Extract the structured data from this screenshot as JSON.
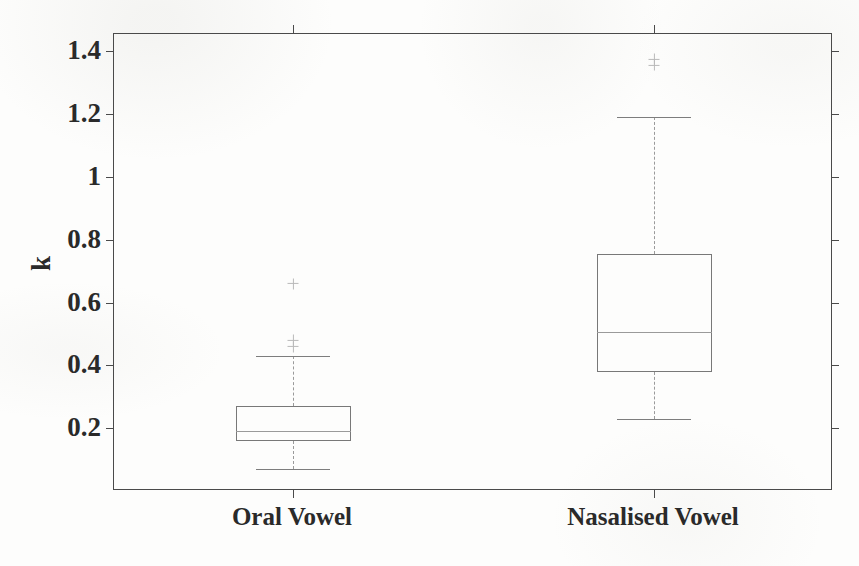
{
  "chart_data": {
    "type": "box",
    "title": "",
    "xlabel": "",
    "ylabel": "k",
    "categories": [
      "Oral Vowel",
      "Nasalised Vowel"
    ],
    "ylim": [
      0.0,
      1.455
    ],
    "yticks": [
      0.2,
      0.4,
      0.6,
      0.8,
      1.0,
      1.2,
      1.4
    ],
    "ytick_labels": [
      "0.2",
      "0.4",
      "0.6",
      "0.8",
      "1",
      "1.2",
      "1.4"
    ],
    "grid": false,
    "legend": null,
    "box_color": "#787878",
    "median_color": "#9a9a9a",
    "whisker_color": "#9a9a9a",
    "outlier_color": "#b9b9b9",
    "axis_color": "#4a4a4a",
    "series": [
      {
        "name": "Oral Vowel",
        "q1": 0.16,
        "median": 0.19,
        "q3": 0.27,
        "whisker_low": 0.07,
        "whisker_high": 0.43,
        "outliers": [
          0.46,
          0.48,
          0.66
        ]
      },
      {
        "name": "Nasalised Vowel",
        "q1": 0.38,
        "median": 0.505,
        "q3": 0.755,
        "whisker_low": 0.23,
        "whisker_high": 1.19,
        "outliers": [
          1.355,
          1.375
        ]
      }
    ]
  },
  "axis": {
    "y_title": "k",
    "tick_0": "0.2",
    "tick_1": "0.4",
    "tick_2": "0.6",
    "tick_3": "0.8",
    "tick_4": "1",
    "tick_5": "1.2",
    "tick_6": "1.4"
  },
  "categories": {
    "left": "Oral Vowel",
    "right": "Nasalised Vowel"
  }
}
